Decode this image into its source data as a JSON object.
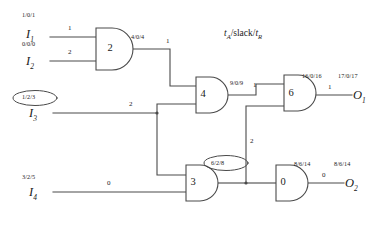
{
  "legend": {
    "text": "tA/slack/tR",
    "t_a": "t",
    "a_sub": "A",
    "mid": "/slack/",
    "t_r": "t",
    "r_sub": "R"
  },
  "inputs": [
    {
      "name": "I",
      "sub": "1",
      "delay": "1/0/1",
      "weight": "1"
    },
    {
      "name": "I",
      "sub": "2",
      "delay": "0/0/0",
      "weight": "2"
    },
    {
      "name": "I",
      "sub": "3",
      "delay": "1/2/3",
      "weight": "2",
      "highlighted": true
    },
    {
      "name": "I",
      "sub": "4",
      "delay": "3/2/5",
      "weight": "0"
    }
  ],
  "outputs": [
    {
      "name": "O",
      "sub": "1",
      "delay": "17/0/17",
      "weight": "1"
    },
    {
      "name": "O",
      "sub": "2",
      "delay": "8/6/14",
      "weight": "0"
    }
  ],
  "gates": [
    {
      "id": "gate-2",
      "label": "2",
      "delay": "4/0/4",
      "highlighted": false
    },
    {
      "id": "gate-4",
      "label": "4",
      "delay": "9/0/9",
      "highlighted": false
    },
    {
      "id": "gate-6",
      "label": "6",
      "delay": "16/0/16",
      "highlighted": false
    },
    {
      "id": "gate-3",
      "label": "3",
      "delay": "6/2/8",
      "highlighted": true
    },
    {
      "id": "gate-0",
      "label": "0",
      "delay": "8/6/14",
      "highlighted": false
    }
  ],
  "edge_weights": {
    "gate2_to_gate4": "1",
    "gate4_to_gate6": "1",
    "gate3_to_gate6": "2"
  },
  "colors": {
    "line": "#4a4a4a",
    "text": "#1a1a1a",
    "background": "#ffffff"
  }
}
